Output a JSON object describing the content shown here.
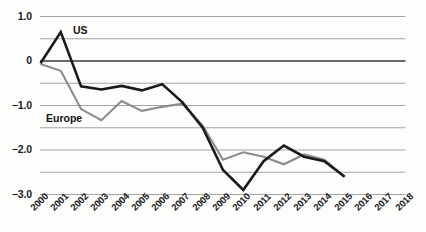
{
  "chart_data": {
    "type": "line",
    "title": "",
    "xlabel": "",
    "ylabel": "",
    "x": [
      2000,
      2001,
      2002,
      2003,
      2004,
      2005,
      2006,
      2007,
      2008,
      2009,
      2010,
      2011,
      2012,
      2013,
      2014,
      2015,
      2016,
      2017,
      2018
    ],
    "xtick_labels": [
      "2000",
      "2001",
      "2002",
      "2003",
      "2004",
      "2005",
      "2006",
      "2007",
      "2008",
      "2009",
      "2010",
      "2011",
      "2012",
      "2013",
      "2014",
      "2015",
      "2016",
      "2017",
      "2018"
    ],
    "ytick_labels": [
      "1.0",
      "0",
      "-1.0",
      "-2.0",
      "-3.0"
    ],
    "ytick_values": [
      1.0,
      0,
      -1.0,
      -2.0,
      -3.0
    ],
    "ylim": [
      -3.2,
      1.1
    ],
    "xlim": [
      2000,
      2018
    ],
    "grid": true,
    "gridline_values": [
      1.0,
      0.5,
      0,
      -0.5,
      -1.0,
      -1.5,
      -2.0,
      -2.5,
      -3.0
    ],
    "zero_line_value": 0,
    "legend_position": "inline-annotation",
    "series": [
      {
        "name": "US",
        "color": "#1a1a1a",
        "x": [
          2000,
          2001,
          2002,
          2003,
          2004,
          2005,
          2006,
          2007,
          2008,
          2009,
          2010,
          2011,
          2012,
          2013,
          2014,
          2015
        ],
        "values": [
          -0.05,
          0.65,
          -0.57,
          -0.64,
          -0.56,
          -0.66,
          -0.52,
          -0.93,
          -1.5,
          -2.45,
          -2.9,
          -2.25,
          -1.9,
          -2.15,
          -2.25,
          -2.6
        ]
      },
      {
        "name": "Europe",
        "color": "#8c8c8c",
        "x": [
          2000,
          2001,
          2002,
          2003,
          2004,
          2005,
          2006,
          2007,
          2008,
          2009,
          2010,
          2011,
          2012,
          2013,
          2014,
          2015
        ],
        "values": [
          -0.07,
          -0.22,
          -1.08,
          -1.33,
          -0.9,
          -1.12,
          -1.03,
          -0.96,
          -1.45,
          -2.22,
          -2.05,
          -2.15,
          -2.32,
          -2.1,
          -2.22,
          -2.6
        ]
      }
    ],
    "colors": {
      "us_line": "#1a1a1a",
      "europe_line": "#8c8c8c",
      "gridline": "#9a9a9a",
      "zero_line": "#3a3a3a",
      "text": "#1a1a1a",
      "background": "#fdfdfc"
    }
  }
}
